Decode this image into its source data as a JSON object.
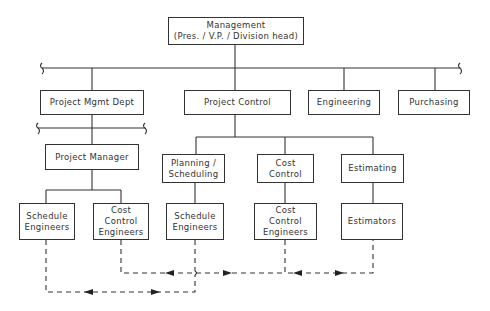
{
  "diagram": {
    "type": "org-chart",
    "nodes": {
      "management": "Management\n(Pres. / V.P. / Division  head)",
      "project_mgmt_dept": "Project Mgmt Dept",
      "project_control": "Project Control",
      "engineering": "Engineering",
      "purchasing": "Purchasing",
      "project_manager": "Project Manager",
      "planning_scheduling": "Planning /\nScheduling",
      "cost_control": "Cost\nControl",
      "estimating": "Estimating",
      "schedule_engineers_pm": "Schedule\nEngineers",
      "cost_control_engineers_pm": "Cost\nControl\nEngineers",
      "schedule_engineers_pc": "Schedule\nEngineers",
      "cost_control_engineers_pc": "Cost\nControl\nEngineers",
      "estimators": "Estimators"
    },
    "edges": [
      {
        "from": "management",
        "to": "project_mgmt_dept",
        "style": "solid"
      },
      {
        "from": "management",
        "to": "project_control",
        "style": "solid"
      },
      {
        "from": "management",
        "to": "engineering",
        "style": "solid"
      },
      {
        "from": "management",
        "to": "purchasing",
        "style": "solid"
      },
      {
        "from": "project_mgmt_dept",
        "to": "project_manager",
        "style": "solid"
      },
      {
        "from": "project_manager",
        "to": "schedule_engineers_pm",
        "style": "solid"
      },
      {
        "from": "project_manager",
        "to": "cost_control_engineers_pm",
        "style": "solid"
      },
      {
        "from": "project_control",
        "to": "planning_scheduling",
        "style": "solid"
      },
      {
        "from": "project_control",
        "to": "cost_control",
        "style": "solid"
      },
      {
        "from": "project_control",
        "to": "estimating",
        "style": "solid"
      },
      {
        "from": "planning_scheduling",
        "to": "schedule_engineers_pc",
        "style": "solid"
      },
      {
        "from": "cost_control",
        "to": "cost_control_engineers_pc",
        "style": "solid"
      },
      {
        "from": "estimating",
        "to": "estimators",
        "style": "solid"
      },
      {
        "from": "schedule_engineers_pm",
        "to": "schedule_engineers_pc",
        "style": "dashed",
        "bidirectional": true
      },
      {
        "from": "cost_control_engineers_pm",
        "to": "cost_control_engineers_pc",
        "style": "dashed",
        "bidirectional": true
      },
      {
        "from": "cost_control_engineers_pc",
        "to": "estimators",
        "style": "dashed",
        "bidirectional": true
      }
    ]
  }
}
